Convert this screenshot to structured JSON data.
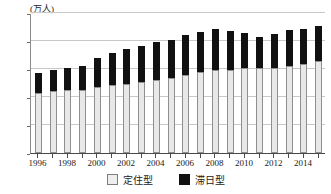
{
  "chart_data": {
    "type": "bar",
    "subtype": "stacked",
    "title": "",
    "unit_label": "(万人)",
    "xlabel": "",
    "ylabel": "",
    "ylim": [
      0,
      250
    ],
    "y_ticks": [
      0,
      50,
      100,
      150,
      200,
      250
    ],
    "grid": true,
    "legend_position": "bottom-center",
    "categories": [
      "1996",
      "1997",
      "1998",
      "1999",
      "2000",
      "2001",
      "2002",
      "2003",
      "2004",
      "2005",
      "2006",
      "2007",
      "2008",
      "2009",
      "2010",
      "2011",
      "2012",
      "2013",
      "2014",
      "2015"
    ],
    "x_tick_labels": [
      "1996",
      "1998",
      "2000",
      "2002",
      "2004",
      "2006",
      "2008",
      "2010",
      "2012",
      "2014"
    ],
    "series": [
      {
        "name": "定住型",
        "color": "#e8e8e8",
        "values": [
          107,
          111,
          112,
          113,
          118,
          121,
          124,
          126,
          130,
          134,
          139,
          144,
          148,
          149,
          151,
          151,
          152,
          155,
          159,
          164
        ]
      },
      {
        "name": "滞日型",
        "color": "#111111",
        "values": [
          36,
          38,
          39,
          42,
          51,
          58,
          62,
          66,
          68,
          67,
          71,
          73,
          74,
          68,
          63,
          57,
          60,
          64,
          62,
          63
        ]
      }
    ],
    "totals": [
      143,
      149,
      151,
      155,
      169,
      179,
      186,
      192,
      198,
      201,
      210,
      217,
      222,
      217,
      214,
      208,
      212,
      219,
      221,
      227
    ]
  },
  "legend": {
    "items": [
      {
        "label": "定住型",
        "swatch": "light-square-icon"
      },
      {
        "label": "滞日型",
        "swatch": "dark-square-icon"
      }
    ]
  }
}
